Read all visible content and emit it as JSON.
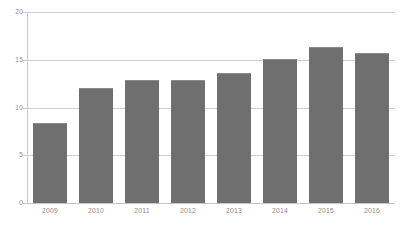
{
  "chart_data": {
    "type": "bar",
    "title": "",
    "xlabel": "",
    "ylabel": "",
    "categories": [
      "2009",
      "2010",
      "2011",
      "2012",
      "2013",
      "2014",
      "2015",
      "2016"
    ],
    "values": [
      8.4,
      12.0,
      12.9,
      12.9,
      13.6,
      15.1,
      16.3,
      15.7
    ],
    "series": [
      {
        "name": "",
        "values": [
          8.4,
          12.0,
          12.9,
          12.9,
          13.6,
          15.1,
          16.3,
          15.7
        ]
      }
    ],
    "ylim": [
      0,
      20
    ],
    "yticks": [
      0,
      5,
      10,
      15,
      20
    ],
    "ytick_labels": [
      "0",
      "5",
      "10",
      "15",
      "20"
    ],
    "grid": true,
    "grid_axis": "y",
    "legend": false,
    "legend_position": "none",
    "bar_color": "#6f6f6f",
    "grid_color": "#d0d0d0",
    "axis_color": "#c9c9c9",
    "label_color": "#8d8d8d",
    "background_color": "#ffffff"
  }
}
